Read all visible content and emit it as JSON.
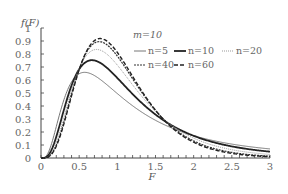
{
  "chart_data": {
    "type": "line",
    "title": "",
    "xlabel": "F",
    "ylabel": "f(F)",
    "xlim": [
      0,
      3
    ],
    "ylim": [
      0,
      1
    ],
    "x_ticks": [
      "0",
      "0.5",
      "1",
      "1.5",
      "2",
      "2.5",
      "3"
    ],
    "y_ticks": [
      "0",
      "0.1",
      "0.2",
      "0.3",
      "0.4",
      "0.5",
      "0.6",
      "0.7",
      "0.8",
      "0.9",
      "1"
    ],
    "grid": false,
    "legend_title": "m=10",
    "legend_position": "upper right",
    "distribution": "F-distribution pdf",
    "m": 10,
    "x": [
      0,
      0.25,
      0.5,
      0.75,
      1.0,
      1.25,
      1.5,
      1.75,
      2.0,
      2.5,
      3.0
    ],
    "series": [
      {
        "name": "n=5",
        "n": 5,
        "style": "solid-thin",
        "color": "#777777",
        "width": 1.0,
        "dash": "",
        "values": [
          0,
          0.36,
          0.64,
          0.61,
          0.5,
          0.39,
          0.3,
          0.23,
          0.17,
          0.1,
          0.06
        ]
      },
      {
        "name": "n=10",
        "n": 10,
        "style": "solid-thick",
        "color": "#222222",
        "width": 1.8,
        "dash": "",
        "values": [
          0,
          0.33,
          0.72,
          0.72,
          0.56,
          0.4,
          0.28,
          0.19,
          0.13,
          0.06,
          0.03
        ]
      },
      {
        "name": "n=20",
        "n": 20,
        "style": "dotted",
        "color": "#999999",
        "width": 1.0,
        "dash": "1,1",
        "values": [
          0,
          0.29,
          0.75,
          0.82,
          0.64,
          0.43,
          0.27,
          0.16,
          0.1,
          0.04,
          0.015
        ]
      },
      {
        "name": "n=40",
        "n": 40,
        "style": "dashed-fine",
        "color": "#333333",
        "width": 1.2,
        "dash": "2,1",
        "values": [
          0,
          0.27,
          0.76,
          0.88,
          0.69,
          0.45,
          0.26,
          0.15,
          0.08,
          0.02,
          0.007
        ]
      },
      {
        "name": "n=60",
        "n": 60,
        "style": "dashed",
        "color": "#222222",
        "width": 1.4,
        "dash": "4,2",
        "values": [
          0,
          0.26,
          0.76,
          0.9,
          0.71,
          0.45,
          0.26,
          0.14,
          0.07,
          0.02,
          0.005
        ]
      }
    ]
  },
  "axes": {
    "x_title": "F",
    "y_title": "f(F)"
  },
  "legend": {
    "title": "m=10",
    "items": [
      {
        "label": "n=5"
      },
      {
        "label": "n=10"
      },
      {
        "label": "n=20"
      },
      {
        "label": "n=40"
      },
      {
        "label": "n=60"
      }
    ]
  }
}
